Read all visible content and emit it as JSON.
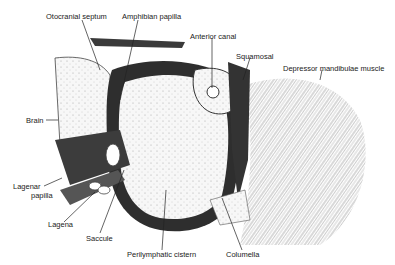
{
  "diagram": {
    "labels": {
      "otocranial_septum": "Otocranial septum",
      "amphibian_papilla": "Amphibian papilla",
      "anterior_canal": "Anterior canal",
      "squamosal": "Squamosal",
      "depressor_mandibulae_muscle": "Depressor mandibulae muscle",
      "brain": "Brain",
      "lagenar_papilla_line1": "Lagenar",
      "lagenar_papilla_line2": "papilla",
      "lagena": "Lagena",
      "saccule": "Saccule",
      "perilymphatic_cistern": "Perilymphatic cistern",
      "columella": "Columella"
    },
    "colors": {
      "ink": "#222222",
      "dark_tissue": "#2e2e2e",
      "stipple_bg": "#f4f4f4",
      "paper": "#ffffff"
    }
  }
}
